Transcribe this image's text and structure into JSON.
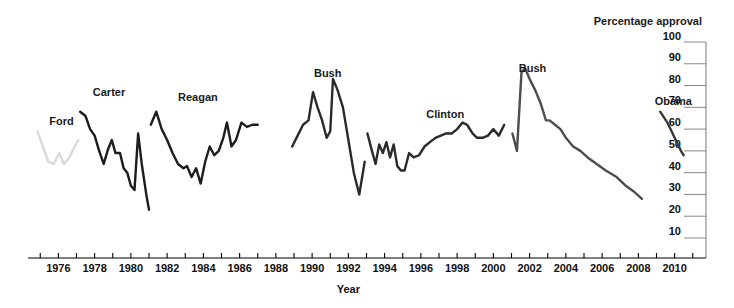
{
  "chart_data": {
    "type": "line",
    "title": "Percentage approval",
    "xlabel": "Year",
    "ylabel": "Percentage approval",
    "grid": true,
    "legend_position": "inline-annotations",
    "xlim": [
      1974.6,
      1911.0
    ],
    "x_axis": {
      "min": 1974.6,
      "max": 2011.4,
      "tick_step": 1,
      "label_step": 2,
      "tick_labels": [
        "1976",
        "1978",
        "1980",
        "1982",
        "1984",
        "1986",
        "1988",
        "1990",
        "1992",
        "1994",
        "1996",
        "1998",
        "2000",
        "2002",
        "2004",
        "2006",
        "2008",
        "2010"
      ],
      "tick_values": [
        1976,
        1978,
        1980,
        1982,
        1984,
        1986,
        1988,
        1990,
        1992,
        1994,
        1996,
        1998,
        2000,
        2002,
        2004,
        2006,
        2008,
        2010
      ]
    },
    "y_axis": {
      "min": 0,
      "max": 100,
      "tick_step": 10,
      "tick_labels": [
        "100",
        "90",
        "80",
        "70",
        "60",
        "50",
        "40",
        "30",
        "20",
        "10"
      ],
      "tick_values": [
        100,
        90,
        80,
        70,
        60,
        50,
        40,
        30,
        20,
        10
      ]
    },
    "series": [
      {
        "name": "Ford",
        "label": "Ford",
        "color": "#d9d9d9",
        "label_x": 1975.5,
        "label_y": 62,
        "points": [
          [
            1974.85,
            59
          ],
          [
            1975.15,
            52
          ],
          [
            1975.45,
            45
          ],
          [
            1975.75,
            44
          ],
          [
            1976.05,
            49
          ],
          [
            1976.3,
            44
          ],
          [
            1976.6,
            47
          ],
          [
            1976.9,
            52
          ],
          [
            1977.1,
            55
          ]
        ]
      },
      {
        "name": "Carter",
        "label": "Carter",
        "color": "#1c1c1c",
        "label_x": 1977.9,
        "label_y": 75,
        "points": [
          [
            1977.2,
            68
          ],
          [
            1977.5,
            66
          ],
          [
            1977.75,
            60
          ],
          [
            1978.0,
            57
          ],
          [
            1978.25,
            50
          ],
          [
            1978.5,
            44
          ],
          [
            1978.75,
            51
          ],
          [
            1978.95,
            55
          ],
          [
            1979.15,
            49
          ],
          [
            1979.4,
            49
          ],
          [
            1979.6,
            42
          ],
          [
            1979.8,
            40
          ],
          [
            1980.0,
            34
          ],
          [
            1980.2,
            32
          ],
          [
            1980.4,
            58
          ],
          [
            1980.6,
            44
          ],
          [
            1980.85,
            30
          ],
          [
            1981.0,
            23
          ]
        ]
      },
      {
        "name": "Reagan",
        "label": "Reagan",
        "color": "#1c1c1c",
        "label_x": 1982.6,
        "label_y": 73,
        "points": [
          [
            1981.1,
            62
          ],
          [
            1981.4,
            68
          ],
          [
            1981.7,
            60
          ],
          [
            1982.0,
            55
          ],
          [
            1982.3,
            49
          ],
          [
            1982.6,
            44
          ],
          [
            1982.9,
            42
          ],
          [
            1983.1,
            43
          ],
          [
            1983.35,
            38
          ],
          [
            1983.6,
            42
          ],
          [
            1983.85,
            35
          ],
          [
            1984.1,
            45
          ],
          [
            1984.35,
            52
          ],
          [
            1984.6,
            48
          ],
          [
            1984.85,
            50
          ],
          [
            1985.1,
            56
          ],
          [
            1985.3,
            63
          ],
          [
            1985.55,
            52
          ],
          [
            1985.8,
            55
          ],
          [
            1986.1,
            63
          ],
          [
            1986.4,
            61
          ],
          [
            1986.7,
            62
          ],
          [
            1987.0,
            62
          ]
        ]
      },
      {
        "name": "Bush",
        "label": "Bush",
        "color": "#2a2a2a",
        "label_x": 1990.1,
        "label_y": 84,
        "points": [
          [
            1988.9,
            52
          ],
          [
            1989.2,
            57
          ],
          [
            1989.5,
            62
          ],
          [
            1989.8,
            64
          ],
          [
            1990.05,
            77
          ],
          [
            1990.3,
            70
          ],
          [
            1990.55,
            64
          ],
          [
            1990.8,
            56
          ],
          [
            1991.0,
            59
          ],
          [
            1991.15,
            83
          ],
          [
            1991.4,
            78
          ],
          [
            1991.7,
            70
          ],
          [
            1992.0,
            55
          ],
          [
            1992.3,
            40
          ],
          [
            1992.6,
            30
          ],
          [
            1992.9,
            45
          ]
        ]
      },
      {
        "name": "Clinton",
        "label": "Clinton",
        "color": "#2a2a2a",
        "label_x": 1996.3,
        "label_y": 65,
        "points": [
          [
            1993.05,
            58
          ],
          [
            1993.3,
            50
          ],
          [
            1993.5,
            44
          ],
          [
            1993.7,
            53
          ],
          [
            1993.9,
            49
          ],
          [
            1994.1,
            54
          ],
          [
            1994.3,
            47
          ],
          [
            1994.5,
            53
          ],
          [
            1994.7,
            43
          ],
          [
            1994.9,
            41
          ],
          [
            1995.1,
            41
          ],
          [
            1995.35,
            49
          ],
          [
            1995.6,
            47
          ],
          [
            1995.9,
            48
          ],
          [
            1996.2,
            52
          ],
          [
            1996.5,
            54
          ],
          [
            1996.8,
            56
          ],
          [
            1997.1,
            57
          ],
          [
            1997.4,
            58
          ],
          [
            1997.7,
            58
          ],
          [
            1998.0,
            60
          ],
          [
            1998.3,
            63
          ],
          [
            1998.55,
            62
          ],
          [
            1998.85,
            58
          ],
          [
            1999.1,
            56
          ],
          [
            1999.4,
            56
          ],
          [
            1999.7,
            57
          ],
          [
            2000.0,
            60
          ],
          [
            2000.3,
            57
          ],
          [
            2000.6,
            62
          ]
        ]
      },
      {
        "name": "Bush ",
        "label": "Bush",
        "color": "#4d4d4d",
        "label_x": 2001.4,
        "label_y": 86,
        "points": [
          [
            2001.05,
            58
          ],
          [
            2001.3,
            50
          ],
          [
            2001.55,
            86
          ],
          [
            2001.75,
            88
          ],
          [
            2002.0,
            83
          ],
          [
            2002.3,
            78
          ],
          [
            2002.6,
            72
          ],
          [
            2002.9,
            64
          ],
          [
            2003.1,
            64
          ],
          [
            2003.4,
            62
          ],
          [
            2003.7,
            60
          ],
          [
            2004.0,
            56
          ],
          [
            2004.4,
            52
          ],
          [
            2004.8,
            50
          ],
          [
            2005.2,
            47
          ],
          [
            2005.7,
            44
          ],
          [
            2006.2,
            41
          ],
          [
            2006.8,
            38
          ],
          [
            2007.3,
            34
          ],
          [
            2007.8,
            31
          ],
          [
            2008.2,
            28
          ]
        ]
      },
      {
        "name": "Obama",
        "label": "Obama",
        "color": "#3a3a3a",
        "label_x": 2008.9,
        "label_y": 71,
        "points": [
          [
            2009.2,
            68
          ],
          [
            2009.6,
            63
          ],
          [
            2010.0,
            56
          ],
          [
            2010.35,
            50
          ],
          [
            2010.5,
            48
          ]
        ]
      }
    ]
  }
}
